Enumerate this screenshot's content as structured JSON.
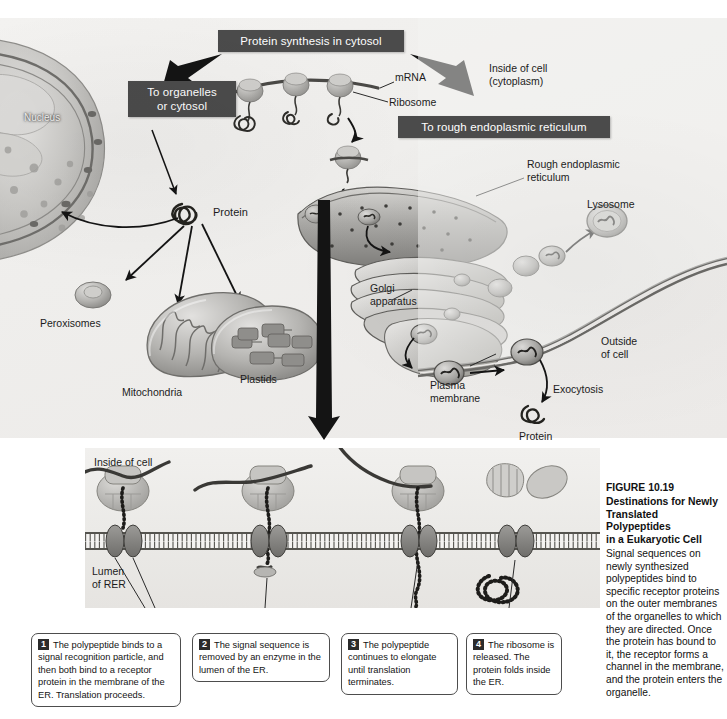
{
  "figure": {
    "number": "FIGURE 10.19",
    "title_lines": "Destinations for Newly\nTranslated Polypeptides\nin a Eukaryotic Cell",
    "body": "Signal sequences on newly synthesized polypeptides bind to specific receptor proteins on the outer membranes of the organelles to which they are directed. Once the protein has bound to it, the receptor forms a channel in the membrane, and the protein enters the organelle."
  },
  "banners": [
    {
      "id": "protein-synthesis",
      "text": "Protein synthesis in cytosol"
    },
    {
      "id": "to-organelles",
      "text": "To organelles\nor cytosol"
    },
    {
      "id": "to-rough-er",
      "text": "To rough endoplasmic reticulum"
    }
  ],
  "top_labels": [
    {
      "id": "nucleus",
      "text": "Nucleus"
    },
    {
      "id": "mrna",
      "text": "mRNA"
    },
    {
      "id": "ribosome",
      "text": "Ribosome"
    },
    {
      "id": "inside-of-cell",
      "text": "Inside of cell\n(cytoplasm)"
    },
    {
      "id": "protein-cytosol",
      "text": "Protein"
    },
    {
      "id": "peroxisomes",
      "text": "Peroxisomes"
    },
    {
      "id": "mitochondria",
      "text": "Mitochondria"
    },
    {
      "id": "plastids",
      "text": "Plastids"
    },
    {
      "id": "rough-er",
      "text": "Rough endoplasmic\nreticulum"
    },
    {
      "id": "lysosome",
      "text": "Lysosome"
    },
    {
      "id": "golgi",
      "text": "Golgi\napparatus"
    },
    {
      "id": "outside-of-cell",
      "text": "Outside\nof cell"
    },
    {
      "id": "plasma-membrane",
      "text": "Plasma\nmembrane"
    },
    {
      "id": "exocytosis",
      "text": "Exocytosis"
    },
    {
      "id": "protein-secreted",
      "text": "Protein"
    }
  ],
  "inset_labels": [
    {
      "id": "inside-of-cell-inset",
      "text": "Inside of cell"
    },
    {
      "id": "lumen-of-rer",
      "text": "Lumen\nof RER"
    }
  ],
  "steps": [
    {
      "num": "1",
      "text": "The polypeptide binds to a signal recognition particle, and then both bind to a receptor protein in the membrane of the ER. Translation proceeds."
    },
    {
      "num": "2",
      "text": "The signal sequence is removed by an enzyme in the lumen of the ER."
    },
    {
      "num": "3",
      "text": "The polypeptide continues to elongate until translation terminates."
    },
    {
      "num": "4",
      "text": "The ribosome is released. The protein folds inside the ER."
    }
  ],
  "colors": {
    "banner_bg": "#4b4b4b",
    "banner_text": "#ffffff",
    "panel_bg": "#efeeec",
    "inset_bg": "#eae9e6",
    "ink": "#1a1a1a",
    "membrane": "#6e6e6e",
    "organelle_fill": "#b9b9b9"
  }
}
